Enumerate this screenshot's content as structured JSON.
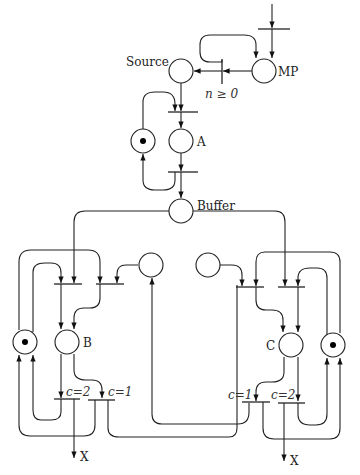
{
  "diagram": {
    "type": "petri-net",
    "places": {
      "source": {
        "label": "Source",
        "tokens": 0
      },
      "mp": {
        "label": "MP",
        "tokens": 0
      },
      "a": {
        "label": "A",
        "tokens": 0
      },
      "a_control": {
        "label": "",
        "tokens": 1
      },
      "buffer": {
        "label": "Buffer",
        "tokens": 0
      },
      "b": {
        "label": "B",
        "tokens": 0
      },
      "b_control": {
        "label": "",
        "tokens": 1
      },
      "c": {
        "label": "C",
        "tokens": 0
      },
      "c_control": {
        "label": "",
        "tokens": 1
      },
      "mid_left": {
        "label": "",
        "tokens": 0
      },
      "mid_right": {
        "label": "",
        "tokens": 0
      }
    },
    "transitions": {
      "guard_n": {
        "label": "n ≥ 0"
      },
      "b_out_2": {
        "label": "c=2"
      },
      "b_out_1": {
        "label": "c=1"
      },
      "c_out_1": {
        "label": "c=1"
      },
      "c_out_2": {
        "label": "c=2"
      }
    },
    "outputs": {
      "left_exit": "X",
      "right_exit": "X"
    }
  }
}
